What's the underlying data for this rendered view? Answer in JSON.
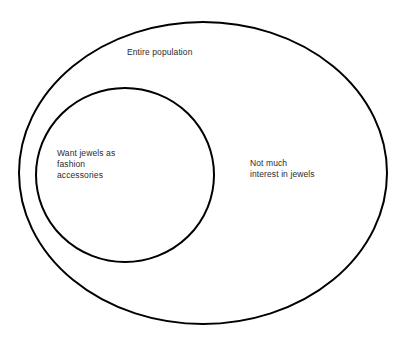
{
  "diagram": {
    "type": "euler-diagram",
    "title": "",
    "background_color": "#ffffff",
    "stroke_color": "#000000",
    "text_color": "#2b2b2b",
    "stroke_width": 2,
    "universe": {
      "label": "Entire population",
      "shape": "ellipse",
      "center_x": 203,
      "center_y": 173,
      "radius_x": 184,
      "radius_y": 151
    },
    "subset": {
      "label": "Want jewels as\nfashion\naccessories",
      "shape": "circle",
      "center_x": 125,
      "center_y": 175,
      "radius_x": 89,
      "radius_y": 87
    },
    "complement": {
      "label": "Not much\ninterest in jewels"
    }
  },
  "chart_data": {
    "type": "diagram",
    "title": "Entire population",
    "categories": [
      "Want jewels as fashion accessories",
      "Not much interest in jewels"
    ],
    "relation": "subset"
  }
}
